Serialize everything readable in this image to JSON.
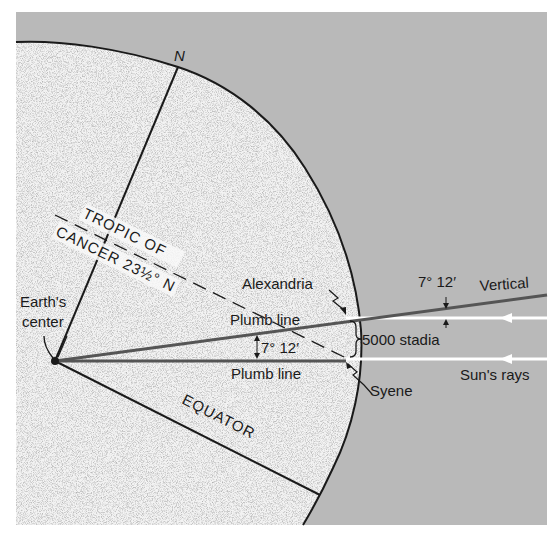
{
  "diagram": {
    "colors": {
      "background": "#b9b9b9",
      "earth_fill": "#f2f2f2",
      "outline": "#1a1a1a",
      "plumb_line": "#555555",
      "sun_rays": "#ffffff"
    },
    "labels": {
      "north": "N",
      "tropic_line1": "TROPIC OF",
      "tropic_line2": "CANCER 23½° N",
      "alexandria": "Alexandria",
      "plumb_line_upper": "Plumb line",
      "plumb_line_lower": "Plumb line",
      "angle_center": "7° 12′",
      "angle_vertical": "7° 12′",
      "vertical": "Vertical",
      "distance": "5000 stadia",
      "sun_rays": "Sun's rays",
      "syene": "Syene",
      "earth_center_line1": "Earth's",
      "earth_center_line2": "center",
      "equator": "EQUATOR"
    }
  }
}
